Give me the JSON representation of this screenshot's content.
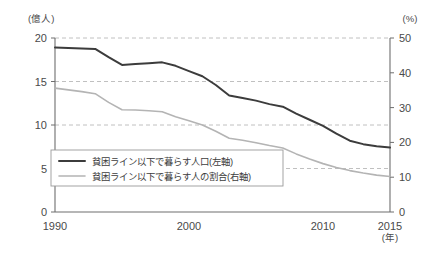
{
  "chart_data": {
    "type": "line",
    "title": "",
    "subtitle": "",
    "xlabel": "(年)",
    "ylabel_left": "(億人)",
    "ylabel_right": "(%)",
    "x": [
      1990,
      1991,
      1992,
      1993,
      1994,
      1995,
      1996,
      1997,
      1998,
      1999,
      2000,
      2001,
      2002,
      2003,
      2004,
      2005,
      2006,
      2007,
      2008,
      2009,
      2010,
      2011,
      2012,
      2013,
      2014,
      2015
    ],
    "xlim": [
      1990,
      2015
    ],
    "x_ticks": [
      1990,
      2000,
      2010,
      2015
    ],
    "x_tick_labels": [
      "1990",
      "2000",
      "2010",
      "2015"
    ],
    "ylim_left": [
      0,
      20
    ],
    "y_ticks_left": [
      0,
      5,
      10,
      15,
      20
    ],
    "y_tick_labels_left": [
      "0",
      "5",
      "10",
      "15",
      "20"
    ],
    "ylim_right": [
      0,
      50
    ],
    "y_ticks_right": [
      0,
      10,
      20,
      30,
      40,
      50
    ],
    "y_tick_labels_right": [
      "0",
      "10",
      "20",
      "30",
      "40",
      "50"
    ],
    "grid": "horizontal-dashed",
    "legend_position": "bottom-left",
    "series": [
      {
        "name": "貧困ライン以下で暮らす人口(左軸)",
        "axis": "left",
        "unit": "億人",
        "color": "#3c3c3c",
        "width": 2.0,
        "values": [
          18.9,
          18.85,
          18.8,
          18.75,
          17.8,
          16.9,
          17.0,
          17.1,
          17.2,
          16.8,
          16.2,
          15.6,
          14.6,
          13.4,
          13.1,
          12.8,
          12.4,
          12.1,
          11.3,
          10.6,
          9.9,
          9.0,
          8.2,
          7.8,
          7.55,
          7.4
        ]
      },
      {
        "name": "貧困ライン以下で暮らす人の割合(右軸)",
        "axis": "right",
        "unit": "%",
        "color": "#b4b4b4",
        "width": 1.6,
        "values": [
          35.6,
          35.1,
          34.6,
          34.0,
          31.5,
          29.4,
          29.3,
          29.1,
          28.8,
          27.4,
          26.2,
          25.0,
          23.2,
          21.2,
          20.6,
          19.9,
          19.1,
          18.4,
          16.7,
          15.2,
          13.9,
          12.8,
          11.9,
          11.2,
          10.6,
          10.2
        ]
      }
    ]
  },
  "legend": {
    "items": [
      {
        "label": "貧困ライン以下で暮らす人口(左軸)",
        "color": "#3c3c3c",
        "width": 2.0
      },
      {
        "label": "貧困ライン以下で暮らす人の割合(右軸)",
        "color": "#b4b4b4",
        "width": 1.6
      }
    ]
  }
}
